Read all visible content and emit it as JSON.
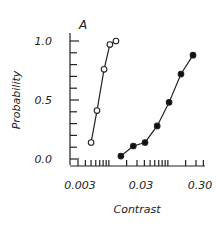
{
  "chart_data": {
    "type": "line",
    "panel_label": "A",
    "title": "",
    "xlabel": "Contrast",
    "ylabel": "Probability",
    "xscale": "log",
    "xlim": [
      0.0022,
      0.42
    ],
    "ylim": [
      0.0,
      1.0
    ],
    "xticks_labeled": [
      "0.003",
      "0.03",
      "0.30"
    ],
    "yticks_labeled": [
      "0.0",
      "0.5",
      "1.0"
    ],
    "grid": false,
    "legend": null,
    "series": [
      {
        "name": "open-circles",
        "marker": "open-circle",
        "x": [
          0.005,
          0.0063,
          0.0083,
          0.0104,
          0.0132
        ],
        "y": [
          0.14,
          0.41,
          0.76,
          0.97,
          1.0
        ]
      },
      {
        "name": "filled-circles",
        "marker": "filled-circle",
        "x": [
          0.016,
          0.026,
          0.041,
          0.066,
          0.105,
          0.167,
          0.267
        ],
        "y": [
          0.025,
          0.11,
          0.14,
          0.28,
          0.48,
          0.72,
          0.88
        ]
      }
    ]
  },
  "labels": {
    "panel": "A",
    "ylabel": "Probability",
    "xlabel": "Contrast",
    "y_ticks": [
      "1.0",
      "0.5",
      "0.0"
    ],
    "x_ticks": [
      "0.003",
      "0.03",
      "0.30"
    ]
  }
}
